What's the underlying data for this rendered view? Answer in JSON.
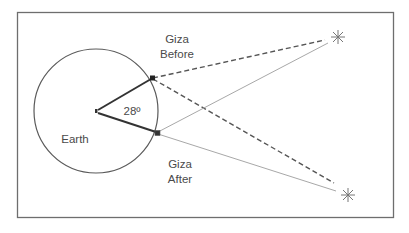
{
  "diagram": {
    "labels": {
      "giza_before_line1": "Giza",
      "giza_before_line2": "Before",
      "giza_after_line1": "Giza",
      "giza_after_line2": "After",
      "angle": "28º",
      "earth": "Earth"
    },
    "colors": {
      "frame": "#6e6e6e",
      "circle": "#5a5a5a",
      "radius_lines": "#333333",
      "dashed_lines": "#555555",
      "thin_lines": "#a8a8a8",
      "stars": "#777777",
      "text": "#4a4a4a"
    },
    "geometry": {
      "earth_center": [
        96,
        111
      ],
      "earth_radius": 62,
      "angle_degrees": 28,
      "giza_before_point": [
        152,
        78
      ],
      "giza_after_point": [
        157,
        133
      ],
      "star_top": [
        338,
        37
      ],
      "star_bottom": [
        348,
        195
      ]
    }
  }
}
